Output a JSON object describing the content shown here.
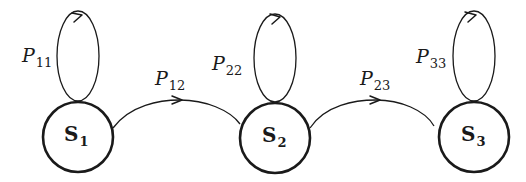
{
  "diagram": {
    "type": "markov-chain-state-diagram",
    "states": [
      {
        "id": "S1",
        "main": "S",
        "sub": "1"
      },
      {
        "id": "S2",
        "main": "S",
        "sub": "2"
      },
      {
        "id": "S3",
        "main": "S",
        "sub": "3"
      }
    ],
    "transitions": [
      {
        "from": "S1",
        "to": "S1",
        "main": "P",
        "sub": "11"
      },
      {
        "from": "S1",
        "to": "S2",
        "main": "P",
        "sub": "12"
      },
      {
        "from": "S2",
        "to": "S2",
        "main": "P",
        "sub": "22"
      },
      {
        "from": "S2",
        "to": "S3",
        "main": "P",
        "sub": "23"
      },
      {
        "from": "S3",
        "to": "S3",
        "main": "P",
        "sub": "33"
      }
    ]
  }
}
